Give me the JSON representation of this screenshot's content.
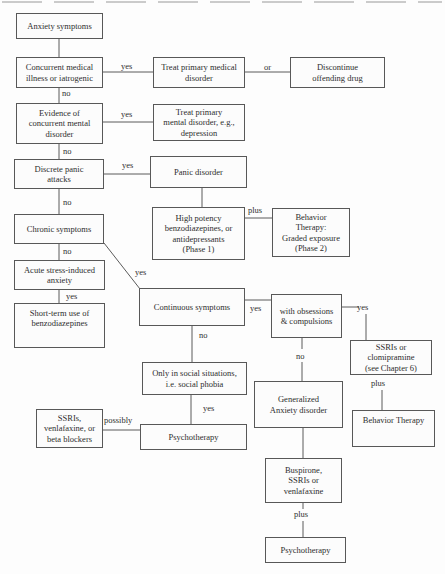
{
  "flowchart": {
    "colors": {
      "box_border": "#585858",
      "text": "#2e2e2e",
      "background": "#fdfdfd",
      "scan_artifact": "#c2c2c2"
    },
    "nodes": {
      "anxiety_symptoms": {
        "label": [
          "Anxiety symptoms"
        ]
      },
      "concurrent_medical": {
        "label": [
          "Concurrent medical",
          "illness or iatrogenic"
        ]
      },
      "treat_medical": {
        "label": [
          "Treat primary medical",
          "disorder"
        ]
      },
      "discontinue_drug": {
        "label": [
          "Discontinue",
          "offending drug"
        ]
      },
      "evidence_mental": {
        "label": [
          "Evidence of",
          "concurrent mental",
          "disorder"
        ]
      },
      "treat_mental": {
        "label": [
          "Treat primary",
          "mental disorder, e.g.,",
          "depression"
        ]
      },
      "discrete_panic": {
        "label": [
          "Discrete panic",
          "attacks"
        ]
      },
      "panic_disorder": {
        "label": [
          "Panic disorder"
        ]
      },
      "high_potency": {
        "label": [
          "High potency",
          "benzodiazepines, or",
          "antidepressants",
          "(Phase 1)"
        ]
      },
      "behavior_graded": {
        "label": [
          "Behavior",
          "Therapy:",
          "Graded exposure",
          "(Phase 2)"
        ]
      },
      "chronic_symptoms": {
        "label": [
          "Chronic symptoms"
        ]
      },
      "acute_stress": {
        "label": [
          "Acute stress-induced",
          "anxiety"
        ]
      },
      "short_term_benzo": {
        "label": [
          "Short-term use of",
          "benzodiazepines"
        ]
      },
      "continuous_symptoms": {
        "label": [
          "Continuous symptoms"
        ]
      },
      "with_obsessions": {
        "label": [
          "with obsessions",
          "& compulsions"
        ]
      },
      "ssris_clomipramine": {
        "label": [
          "SSRIs or",
          "clomipramine",
          "(see Chapter 6)"
        ]
      },
      "only_social": {
        "label": [
          "Only in social situations,",
          "i.e. social phobia"
        ]
      },
      "generalized_anxiety": {
        "label": [
          "Generalized",
          "Anxiety disorder"
        ]
      },
      "behavior_therapy": {
        "label": [
          "Behavior Therapy"
        ]
      },
      "ssris_venlafaxine": {
        "label": [
          "SSRIs,",
          "venlafaxine, or",
          "beta blockers"
        ]
      },
      "psychotherapy_mid": {
        "label": [
          "Psychotherapy"
        ]
      },
      "buspirone": {
        "label": [
          "Buspirone,",
          "SSRIs or",
          "venlafaxine"
        ]
      },
      "psychotherapy_bottom": {
        "label": [
          "Psychotherapy"
        ]
      }
    },
    "edge_labels": {
      "concurrent_yes": "yes",
      "treat_or": "or",
      "concurrent_no": "no",
      "evidence_yes": "yes",
      "evidence_no": "no",
      "discrete_yes": "yes",
      "discrete_no": "no",
      "phase_plus": "plus",
      "chronic_no": "no",
      "chronic_yes": "yes",
      "acute_yes": "yes",
      "continuous_yes": "yes",
      "obsessions_yes": "yes",
      "continuous_no": "no",
      "obsessions_no": "no",
      "clomipramine_plus": "plus",
      "social_yes": "yes",
      "possibly": "possibly",
      "buspirone_plus": "plus"
    }
  }
}
